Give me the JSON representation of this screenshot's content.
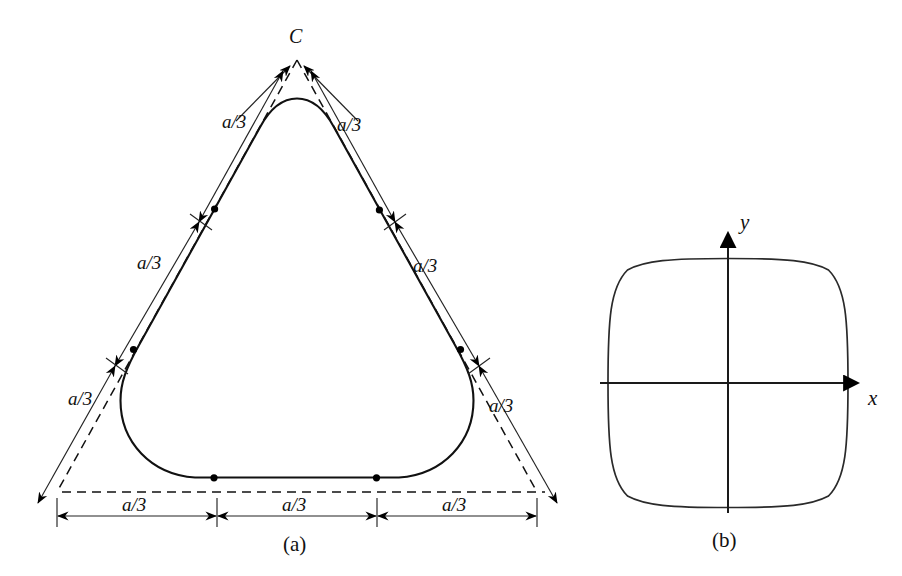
{
  "figure": {
    "background_color": "#ffffff",
    "ink_color": "#111111",
    "panels": [
      {
        "id": "panel-a",
        "caption": "(a)",
        "description": "Rounded equilateral triangle (Reuleaux-like curve) inscribed in a dashed triangle, with each side trisected into a/3 segments",
        "apex_label": "C",
        "dimension_label": "a/3",
        "dimension_labels": [
          {
            "id": "left-upper",
            "text": "a/3",
            "x": 222,
            "y": 112
          },
          {
            "id": "right-upper",
            "text": "a/3",
            "x": 337,
            "y": 115
          },
          {
            "id": "left-middle",
            "text": "a/3",
            "x": 137,
            "y": 253
          },
          {
            "id": "right-middle",
            "text": "a/3",
            "x": 413,
            "y": 256
          },
          {
            "id": "left-lower",
            "text": "a/3",
            "x": 68,
            "y": 389
          },
          {
            "id": "right-lower",
            "text": "a/3",
            "x": 489,
            "y": 396
          },
          {
            "id": "bottom-left",
            "text": "a/3",
            "x": 137,
            "y": 503
          },
          {
            "id": "bottom-center",
            "text": "a/3",
            "x": 275,
            "y": 503
          },
          {
            "id": "bottom-right",
            "text": "a/3",
            "x": 413,
            "y": 503
          }
        ],
        "triangle_vertices": {
          "apex": [
            297,
            60
          ],
          "bottom_left": [
            57,
            492
          ],
          "bottom_right": [
            537,
            492
          ]
        },
        "trisection_dots": 6
      },
      {
        "id": "panel-b",
        "caption": "(b)",
        "description": "Rounded square (squircle) curve centred on the origin of x-y axes",
        "axis_labels": {
          "x": "x",
          "y": "y"
        },
        "center": [
          728,
          383
        ],
        "half_width": 120,
        "half_height": 124
      }
    ]
  }
}
